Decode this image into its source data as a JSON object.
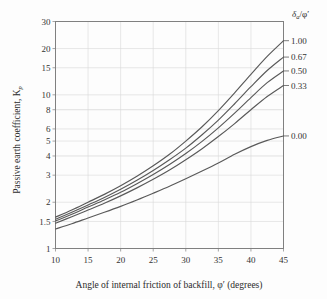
{
  "chart_data": {
    "type": "line",
    "title": "",
    "xlabel": "Angle of internal friction of backfill, φ′ (degrees)",
    "ylabel": "Passive earth coefficient, K",
    "ylabel_sub": "p",
    "xlim": [
      10,
      45
    ],
    "ylim": [
      1,
      30
    ],
    "yscale": "log",
    "xticks": [
      10,
      15,
      20,
      25,
      30,
      35,
      40,
      45
    ],
    "xtick_labels": [
      "10",
      "15",
      "20",
      "25",
      "30",
      "35",
      "40",
      "45"
    ],
    "yticks": [
      1,
      1.5,
      2,
      3,
      4,
      5,
      6,
      8,
      10,
      15,
      20,
      30
    ],
    "ytick_labels": [
      "1",
      "1.5",
      "2",
      "3",
      "4",
      "5",
      "6",
      "8",
      "10",
      "15",
      "20",
      "30"
    ],
    "grid": true,
    "legend_position": "right",
    "legend_title": "δa/φ′",
    "legend_title_parts": {
      "delta": "δ",
      "delta_sub": "a",
      "slash": "/",
      "phi": "φ′"
    },
    "line_color": "#595959",
    "grid_color": "#d8d8d8",
    "axis_color": "#808080",
    "series": [
      {
        "name": "1.00",
        "label": "1.00",
        "x": [
          10,
          12.5,
          15,
          17.5,
          20,
          22.5,
          25,
          27.5,
          30,
          32.5,
          35,
          37.5,
          40,
          42.5,
          45
        ],
        "values": [
          1.6,
          1.78,
          2.0,
          2.25,
          2.56,
          2.95,
          3.45,
          4.1,
          5.0,
          6.2,
          7.9,
          10.3,
          13.6,
          17.8,
          22.5
        ]
      },
      {
        "name": "0.67",
        "label": "0.67",
        "x": [
          10,
          12.5,
          15,
          17.5,
          20,
          22.5,
          25,
          27.5,
          30,
          32.5,
          35,
          37.5,
          40,
          42.5,
          45
        ],
        "values": [
          1.55,
          1.72,
          1.92,
          2.15,
          2.43,
          2.78,
          3.22,
          3.78,
          4.5,
          5.5,
          6.85,
          8.75,
          11.3,
          14.4,
          17.6
        ]
      },
      {
        "name": "0.50",
        "label": "0.50",
        "x": [
          10,
          12.5,
          15,
          17.5,
          20,
          22.5,
          25,
          27.5,
          30,
          32.5,
          35,
          37.5,
          40,
          42.5,
          45
        ],
        "values": [
          1.51,
          1.67,
          1.86,
          2.07,
          2.32,
          2.64,
          3.03,
          3.52,
          4.15,
          4.98,
          6.1,
          7.6,
          9.6,
          12.0,
          14.3
        ]
      },
      {
        "name": "0.33",
        "label": "0.33",
        "x": [
          10,
          12.5,
          15,
          17.5,
          20,
          22.5,
          25,
          27.5,
          30,
          32.5,
          35,
          37.5,
          40,
          42.5,
          45
        ],
        "values": [
          1.46,
          1.61,
          1.78,
          1.97,
          2.2,
          2.48,
          2.82,
          3.24,
          3.78,
          4.46,
          5.35,
          6.5,
          8.0,
          9.75,
          11.5
        ]
      },
      {
        "name": "0.00",
        "label": "0.00",
        "x": [
          10,
          12.5,
          15,
          17.5,
          20,
          22.5,
          25,
          27.5,
          30,
          32.5,
          35,
          37.5,
          40,
          42.5,
          45
        ],
        "values": [
          1.34,
          1.45,
          1.58,
          1.72,
          1.88,
          2.07,
          2.29,
          2.54,
          2.84,
          3.19,
          3.6,
          4.1,
          4.6,
          5.05,
          5.4
        ]
      }
    ]
  },
  "legend": {
    "header_delta": "δ",
    "header_delta_sub": "a",
    "header_rest": "/φ′",
    "entries": [
      "1.00",
      "0.67",
      "0.50",
      "0.33",
      "0.00"
    ]
  },
  "axes": {
    "y_title_main": "Passive earth coefficient, K",
    "y_title_sub": "p",
    "x_title": "Angle of internal friction of backfill, φ′ (degrees)"
  }
}
